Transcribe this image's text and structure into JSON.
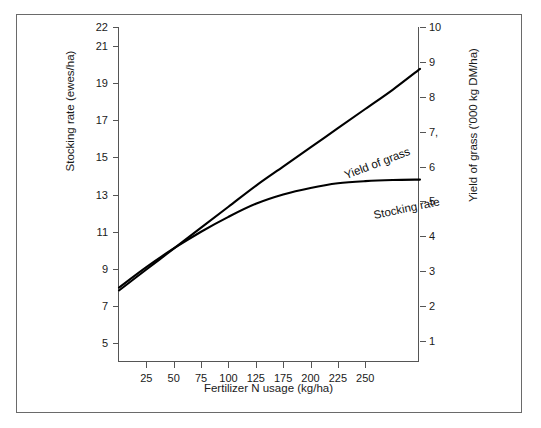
{
  "chart_data": {
    "type": "line",
    "title": "",
    "xlabel": "Fertilizer N usage (kg/ha)",
    "ylabel": "Stocking rate (ewes/ha)",
    "ylabel_right": "Yield of grass ('000 kg DM/ha)",
    "xlim": [
      0,
      275
    ],
    "ylim_left": [
      4,
      22
    ],
    "ylim_right": [
      0.4,
      10
    ],
    "grid": false,
    "legend_position": "inline-on-curves",
    "x_ticks": [
      {
        "value": 25,
        "label": "25"
      },
      {
        "value": 50,
        "label": "50"
      },
      {
        "value": 75,
        "label": "75"
      },
      {
        "value": 100,
        "label": "100"
      },
      {
        "value": 125,
        "label": "125"
      },
      {
        "value": 150,
        "label": "175"
      },
      {
        "value": 175,
        "label": "200"
      },
      {
        "value": 200,
        "label": "225"
      },
      {
        "value": 225,
        "label": "250"
      }
    ],
    "y_ticks_left": [
      {
        "value": 22,
        "label": "22"
      },
      {
        "value": 21,
        "label": "21"
      },
      {
        "value": 19,
        "label": "19"
      },
      {
        "value": 17,
        "label": "17"
      },
      {
        "value": 15,
        "label": "15"
      },
      {
        "value": 13,
        "label": "13"
      },
      {
        "value": 11,
        "label": "11"
      },
      {
        "value": 9,
        "label": "9"
      },
      {
        "value": 7,
        "label": "7"
      },
      {
        "value": 5,
        "label": "5"
      }
    ],
    "y_ticks_right": [
      {
        "value": 10,
        "label": "10"
      },
      {
        "value": 9,
        "label": "9"
      },
      {
        "value": 8,
        "label": "8"
      },
      {
        "value": 7,
        "label": "7,"
      },
      {
        "value": 6,
        "label": "6"
      },
      {
        "value": 5,
        "label": "5"
      },
      {
        "value": 4,
        "label": "4"
      },
      {
        "value": 3,
        "label": "3"
      },
      {
        "value": 2,
        "label": "2"
      },
      {
        "value": 1,
        "label": "1"
      }
    ],
    "series": [
      {
        "name": "Yield of grass",
        "label": "Yield of grass",
        "axis": "right",
        "units": "'000 kg DM/ha",
        "color": "#000000",
        "x": [
          0,
          25,
          50,
          75,
          100,
          125,
          150,
          175,
          200,
          225,
          250,
          275
        ],
        "values": [
          2.45,
          3.05,
          3.65,
          4.25,
          4.85,
          5.45,
          6.0,
          6.55,
          7.1,
          7.65,
          8.2,
          8.8
        ]
      },
      {
        "name": "Stocking rate",
        "label": "Stocking rate",
        "axis": "left",
        "units": "ewes/ha",
        "color": "#000000",
        "x": [
          0,
          25,
          50,
          75,
          100,
          125,
          150,
          175,
          200,
          225,
          250,
          275
        ],
        "values": [
          8.0,
          9.1,
          10.1,
          11.0,
          11.8,
          12.5,
          13.0,
          13.35,
          13.6,
          13.72,
          13.78,
          13.8
        ]
      }
    ],
    "colors": {
      "line": "#000000",
      "axis": "#555555",
      "frame": "#6a6a6a",
      "text": "#1a1a1a",
      "background": "#ffffff"
    }
  }
}
